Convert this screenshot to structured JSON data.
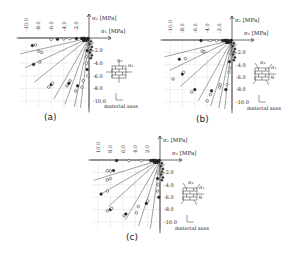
{
  "figure": {
    "panels": [
      {
        "id": "a",
        "label": "(a)",
        "ox": 89,
        "oy": 38,
        "scale": 6.3,
        "x_ticks": [
          "-10.0",
          "-8.0",
          "-6.0",
          "-4.0",
          "-2.0"
        ],
        "y_ticks": [
          "-2.0",
          "-4.0",
          "-6.0",
          "-8.0",
          "-10.0"
        ],
        "theta_label": "",
        "label_pos": [
          44,
          120
        ]
      },
      {
        "id": "b",
        "label": "(b)",
        "ox": 232,
        "oy": 40,
        "scale": 6.2,
        "x_ticks": [
          "-10.0",
          "-8.0",
          "-6.0",
          "-4.0",
          "-2.0"
        ],
        "y_ticks": [
          "-2.0",
          "-4.0",
          "-6.0",
          "-8.0",
          "-10.0"
        ],
        "theta_label": "θ",
        "label_pos": [
          196,
          122
        ]
      },
      {
        "id": "c",
        "label": "(c)",
        "ox": 160,
        "oy": 160,
        "scale": 6.2,
        "x_ticks": [
          "10.0",
          "8.0",
          "6.0",
          "4.0",
          "2.0"
        ],
        "y_ticks": [
          "-2.0",
          "-4.0",
          "-6.0",
          "-8.0",
          "-10.0"
        ],
        "theta_label": "θ",
        "label_pos": [
          126,
          240
        ]
      }
    ],
    "labels": {
      "sigma1": "σ₁ [MPa]",
      "sigma2": "σ₂ [MPa]",
      "material_axes": "material axes",
      "s1": "σ₁",
      "s2": "σ₂"
    }
  },
  "chart_data": [
    {
      "type": "scatter",
      "title": "(a) Biaxial failure envelope, θ = 0°",
      "xlabel": "σ1 [MPa]",
      "ylabel": "σ2 [MPa]",
      "xlim": [
        -11,
        0
      ],
      "ylim": [
        -11,
        0
      ],
      "x_ticks": [
        -10,
        -8,
        -6,
        -4,
        -2
      ],
      "y_ticks": [
        -2,
        -4,
        -6,
        -8,
        -10
      ],
      "grid": true,
      "load_paths_deg": [
        180,
        193,
        205,
        219,
        240,
        250,
        258,
        263,
        270
      ],
      "points": [
        [
          -2.0,
          -0.1
        ],
        [
          -3.0,
          -0.1
        ],
        [
          -4.0,
          -0.15
        ],
        [
          -5.0,
          -0.2
        ],
        [
          -6.0,
          -0.2
        ],
        [
          -8.5,
          -1.1
        ],
        [
          -9.0,
          -1.2
        ],
        [
          -8.0,
          -2.1
        ],
        [
          -7.5,
          -2.3
        ],
        [
          -8.8,
          -4.2
        ],
        [
          -7.8,
          -3.8
        ],
        [
          -6.4,
          -7.8
        ],
        [
          -6.0,
          -7.4
        ],
        [
          -5.8,
          -7.2
        ],
        [
          -3.5,
          -7.6
        ],
        [
          -3.2,
          -7.2
        ],
        [
          -3.0,
          -6.8
        ],
        [
          -2.1,
          -8.4
        ],
        [
          -1.8,
          -7.6
        ],
        [
          -1.1,
          -7.8
        ],
        [
          -0.9,
          -6.8
        ],
        [
          -0.3,
          -2.0
        ],
        [
          -0.4,
          -3.0
        ],
        [
          -0.4,
          -4.0
        ],
        [
          -0.3,
          -5.0
        ],
        [
          -0.2,
          -6.0
        ]
      ]
    },
    {
      "type": "scatter",
      "title": "(b) Biaxial failure envelope, θ = 22.5°",
      "xlabel": "σ1 [MPa]",
      "ylabel": "σ2 [MPa]",
      "xlim": [
        -11,
        0
      ],
      "ylim": [
        -11,
        0
      ],
      "x_ticks": [
        -10,
        -8,
        -6,
        -4,
        -2
      ],
      "y_ticks": [
        -2,
        -4,
        -6,
        -8,
        -10
      ],
      "grid": true,
      "load_paths_deg": [
        180,
        194,
        206,
        222,
        241,
        252,
        259,
        264,
        270
      ],
      "points": [
        [
          -1.5,
          -0.1
        ],
        [
          -2.5,
          -0.1
        ],
        [
          -3.5,
          -0.1
        ],
        [
          -5.0,
          -0.1
        ],
        [
          -4.8,
          -1.8
        ],
        [
          -4.5,
          -1.9
        ],
        [
          -8.5,
          -3.1
        ],
        [
          -7.5,
          -3.0
        ],
        [
          -9.5,
          -6.3
        ],
        [
          -8.0,
          -5.5
        ],
        [
          -7.8,
          -5.2
        ],
        [
          -6.5,
          -8.4
        ],
        [
          -6.0,
          -8.0
        ],
        [
          -4.0,
          -9.8
        ],
        [
          -3.5,
          -8.8
        ],
        [
          -3.3,
          -8.2
        ],
        [
          -2.0,
          -7.6
        ],
        [
          -1.9,
          -7.2
        ],
        [
          -1.0,
          -8.0
        ],
        [
          -0.8,
          -7.2
        ],
        [
          -0.4,
          -2.0
        ],
        [
          -0.4,
          -3.5
        ],
        [
          -0.3,
          -4.5
        ],
        [
          -0.5,
          -5.2
        ]
      ]
    },
    {
      "type": "scatter",
      "title": "(c) Biaxial failure envelope, θ = 45°",
      "xlabel": "σ1 [MPa]",
      "ylabel": "σ2 [MPa]",
      "xlim": [
        -11,
        0
      ],
      "ylim": [
        -11,
        0
      ],
      "x_ticks": [
        10,
        8,
        6,
        4,
        2
      ],
      "y_ticks": [
        -2,
        -4,
        -6,
        -8,
        -10
      ],
      "grid": true,
      "load_paths_deg": [
        180,
        197,
        210,
        222,
        240,
        252,
        262,
        270
      ],
      "points": [
        [
          -1.5,
          -0.1
        ],
        [
          -3.0,
          -0.1
        ],
        [
          -5.0,
          -0.1
        ],
        [
          -7.0,
          -0.1
        ],
        [
          -8.5,
          -1.7
        ],
        [
          -8.0,
          -1.8
        ],
        [
          -7.5,
          -1.7
        ],
        [
          -8.5,
          -3.2
        ],
        [
          -8.0,
          -3.0
        ],
        [
          -9.5,
          -5.5
        ],
        [
          -8.5,
          -5.0
        ],
        [
          -8.5,
          -8.2
        ],
        [
          -8.0,
          -8.0
        ],
        [
          -7.8,
          -7.8
        ],
        [
          -5.8,
          -9.0
        ],
        [
          -5.5,
          -8.7
        ],
        [
          -3.8,
          -8.5
        ],
        [
          -3.5,
          -7.5
        ],
        [
          -2.2,
          -7.0
        ],
        [
          -2.0,
          -6.6
        ],
        [
          -0.3,
          -2.0
        ],
        [
          -0.4,
          -3.0
        ],
        [
          -0.3,
          -4.0
        ],
        [
          -0.4,
          -5.0
        ],
        [
          -0.2,
          -6.0
        ]
      ]
    }
  ]
}
